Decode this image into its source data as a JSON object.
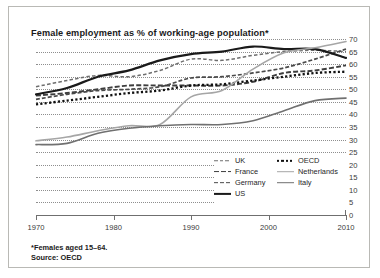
{
  "chart_data": {
    "type": "line",
    "title": "Female employment as % of working-age population*",
    "xlabel": "",
    "ylabel": "",
    "xlim": [
      1970,
      2010
    ],
    "ylim": [
      0,
      70
    ],
    "ytick_step": 5,
    "yticks": [
      70,
      65,
      60,
      55,
      50,
      45,
      40,
      35,
      30,
      25,
      20,
      15,
      10,
      5,
      0
    ],
    "xticks": [
      1970,
      1980,
      1990,
      2000,
      2010
    ],
    "grid": "horizontal-dotted",
    "y_axis_position": "right",
    "legend_position": "inside-bottom-right",
    "footnote": "*Females aged 15–64.",
    "source": "Source: OECD",
    "series": [
      {
        "name": "UK",
        "style": "dashed-light",
        "color": "#6e6e6e",
        "x": [
          1970,
          1974,
          1978,
          1982,
          1986,
          1990,
          1994,
          1998,
          2002,
          2006,
          2010
        ],
        "values": [
          51.0,
          53.5,
          55.5,
          55.0,
          57.5,
          62.0,
          61.5,
          63.5,
          65.0,
          65.5,
          65.0
        ]
      },
      {
        "name": "France",
        "style": "dashed-bold",
        "color": "#3d3d3d",
        "x": [
          1970,
          1974,
          1978,
          1982,
          1986,
          1990,
          1994,
          1998,
          2002,
          2006,
          2010
        ],
        "values": [
          47.5,
          48.5,
          50.0,
          51.5,
          51.5,
          51.5,
          51.5,
          53.0,
          56.5,
          57.5,
          59.5
        ]
      },
      {
        "name": "Germany",
        "style": "dashed-medium",
        "color": "#4a4a4a",
        "x": [
          1970,
          1974,
          1978,
          1982,
          1986,
          1990,
          1994,
          1998,
          2002,
          2006,
          2010
        ],
        "values": [
          46.0,
          48.0,
          49.5,
          50.0,
          51.0,
          54.5,
          55.0,
          56.5,
          58.5,
          62.0,
          66.0
        ]
      },
      {
        "name": "US",
        "style": "solid-thick",
        "color": "#1a1a1a",
        "x": [
          1970,
          1974,
          1978,
          1982,
          1986,
          1990,
          1994,
          1998,
          2002,
          2006,
          2010
        ],
        "values": [
          48.0,
          50.5,
          55.0,
          57.5,
          61.5,
          64.0,
          65.0,
          67.0,
          66.0,
          66.0,
          62.5
        ]
      },
      {
        "name": "OECD",
        "style": "dotted",
        "color": "#111111",
        "x": [
          1970,
          1974,
          1978,
          1982,
          1986,
          1990,
          1994,
          1998,
          2002,
          2006,
          2010
        ],
        "values": [
          44.0,
          45.5,
          47.0,
          48.5,
          49.5,
          51.5,
          52.0,
          53.5,
          55.0,
          56.5,
          57.0
        ]
      },
      {
        "name": "Netherlands",
        "style": "solid-light",
        "color": "#a6a6a6",
        "x": [
          1970,
          1974,
          1978,
          1982,
          1986,
          1990,
          1994,
          1998,
          2002,
          2006,
          2010
        ],
        "values": [
          29.5,
          31.0,
          33.5,
          35.5,
          36.0,
          47.0,
          49.5,
          58.0,
          64.5,
          66.5,
          69.0
        ]
      },
      {
        "name": "Italy",
        "style": "solid-medium",
        "color": "#707070",
        "x": [
          1970,
          1974,
          1978,
          1982,
          1986,
          1990,
          1994,
          1998,
          2002,
          2006,
          2010
        ],
        "values": [
          28.0,
          28.5,
          32.5,
          34.5,
          35.5,
          36.0,
          36.0,
          37.5,
          41.5,
          45.5,
          46.5
        ]
      }
    ]
  },
  "legend": {
    "column1": [
      {
        "label": "UK",
        "style": "dashed-light"
      },
      {
        "label": "France",
        "style": "dashed-bold"
      },
      {
        "label": "Germany",
        "style": "dashed-medium"
      },
      {
        "label": "US",
        "style": "solid-thick"
      }
    ],
    "column2": [
      {
        "label": "OECD",
        "style": "dotted"
      },
      {
        "label": "Netherlands",
        "style": "solid-light"
      },
      {
        "label": "Italy",
        "style": "solid-medium"
      }
    ]
  }
}
